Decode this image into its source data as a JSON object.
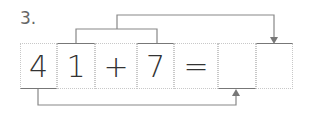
{
  "question_number": "3.",
  "cells": [
    {
      "value": "4",
      "left": 20,
      "width": 37
    },
    {
      "value": "1",
      "left": 57,
      "width": 38
    },
    {
      "value": "+",
      "left": 95,
      "width": 42
    },
    {
      "value": "7",
      "left": 137,
      "width": 37
    },
    {
      "value": "=",
      "left": 174,
      "width": 44
    },
    {
      "value": "",
      "left": 218,
      "width": 38
    },
    {
      "value": "",
      "left": 256,
      "width": 37
    }
  ],
  "colors": {
    "line": "#888888",
    "text": "#333333",
    "dotted_border": "#c8c8c8"
  }
}
